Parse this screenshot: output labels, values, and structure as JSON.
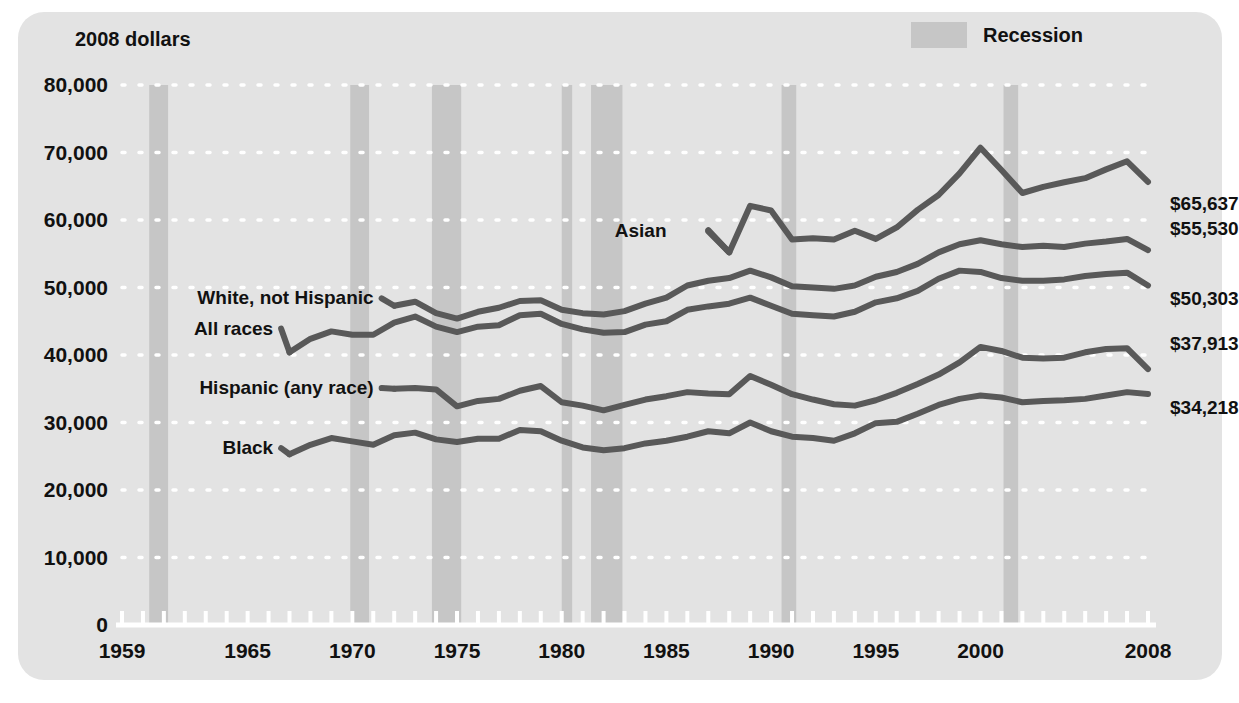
{
  "figure": {
    "unit_label": "2008 dollars",
    "panel_color": "#e3e3e3",
    "line_color": "#595959",
    "recession_color": "#c6c6c6",
    "axis_color": "#ffffff",
    "grid_color": "#ffffff"
  },
  "legend": {
    "position": "top-right",
    "items": [
      {
        "label": "Recession",
        "color": "#c6c6c6",
        "type": "band"
      }
    ]
  },
  "chart_data": {
    "type": "line",
    "title": "",
    "subtitle": "",
    "xlabel": "",
    "ylabel": "2008 dollars",
    "xlim": [
      1959,
      2008
    ],
    "ylim": [
      0,
      80000
    ],
    "grid": "horizontal-dotted",
    "legend_position": "top-right",
    "ytick_labels": [
      "0",
      "10,000",
      "20,000",
      "30,000",
      "40,000",
      "50,000",
      "60,000",
      "70,000",
      "80,000"
    ],
    "ytick_values": [
      0,
      10000,
      20000,
      30000,
      40000,
      50000,
      60000,
      70000,
      80000
    ],
    "xtick_labels": [
      "1959",
      "1965",
      "1970",
      "1975",
      "1980",
      "1985",
      "1990",
      "1995",
      "2000",
      "2008"
    ],
    "xtick_values": [
      1959,
      1965,
      1970,
      1975,
      1980,
      1985,
      1990,
      1995,
      2000,
      2008
    ],
    "x": [
      1959,
      1960,
      1961,
      1962,
      1963,
      1964,
      1965,
      1966,
      1967,
      1968,
      1969,
      1970,
      1971,
      1972,
      1973,
      1974,
      1975,
      1976,
      1977,
      1978,
      1979,
      1980,
      1981,
      1982,
      1983,
      1984,
      1985,
      1986,
      1987,
      1988,
      1989,
      1990,
      1991,
      1992,
      1993,
      1994,
      1995,
      1996,
      1997,
      1998,
      1999,
      2000,
      2001,
      2002,
      2003,
      2004,
      2005,
      2006,
      2007,
      2008
    ],
    "series": [
      {
        "name": "Asian",
        "label": "Asian",
        "end_label": "$65,637",
        "end_value": 65637,
        "label_x": 1987.5,
        "label_y": 58300,
        "start_year": 1987,
        "values": [
          null,
          null,
          null,
          null,
          null,
          null,
          null,
          null,
          null,
          null,
          null,
          null,
          null,
          null,
          null,
          null,
          null,
          null,
          null,
          null,
          null,
          null,
          null,
          null,
          null,
          null,
          null,
          null,
          58500,
          55200,
          62100,
          61400,
          57100,
          57300,
          57100,
          58400,
          57200,
          58900,
          61500,
          63700,
          66900,
          70700,
          67400,
          64000,
          64900,
          65600,
          66200,
          67500,
          68700,
          65637
        ]
      },
      {
        "name": "White, not Hispanic",
        "label": "White, not Hispanic",
        "end_label": "$55,530",
        "end_value": 55530,
        "label_x": 1971.4,
        "label_y": 48400,
        "start_year": 1972,
        "values": [
          null,
          null,
          null,
          null,
          null,
          null,
          null,
          null,
          null,
          null,
          null,
          null,
          null,
          47300,
          47900,
          46200,
          45400,
          46400,
          47000,
          48000,
          48100,
          46700,
          46200,
          46000,
          46500,
          47600,
          48500,
          50300,
          51000,
          51400,
          52500,
          51500,
          50200,
          50000,
          49800,
          50300,
          51600,
          52300,
          53500,
          55200,
          56400,
          57000,
          56400,
          56000,
          56200,
          56000,
          56500,
          56800,
          57200,
          55530
        ]
      },
      {
        "name": "All races",
        "label": "All races",
        "end_label": "$50,303",
        "end_value": 50303,
        "label_x": 1966.6,
        "label_y": 43900,
        "start_year": 1967,
        "values": [
          null,
          null,
          null,
          null,
          null,
          null,
          null,
          null,
          40400,
          42400,
          43500,
          43000,
          43000,
          44800,
          45700,
          44200,
          43400,
          44200,
          44400,
          45900,
          46100,
          44600,
          43800,
          43300,
          43400,
          44500,
          45000,
          46700,
          47200,
          47600,
          48500,
          47300,
          46100,
          45900,
          45700,
          46400,
          47800,
          48400,
          49500,
          51300,
          52500,
          52300,
          51400,
          51000,
          51000,
          51200,
          51700,
          52000,
          52200,
          50303
        ]
      },
      {
        "name": "Hispanic (any race)",
        "label": "Hispanic (any race)",
        "end_label": "$37,913",
        "end_value": 37913,
        "label_x": 1971.4,
        "label_y": 35100,
        "start_year": 1972,
        "values": [
          null,
          null,
          null,
          null,
          null,
          null,
          null,
          null,
          null,
          null,
          null,
          null,
          null,
          35000,
          35100,
          34900,
          32400,
          33200,
          33500,
          34700,
          35400,
          33000,
          32500,
          31800,
          32600,
          33400,
          33900,
          34500,
          34300,
          34200,
          36900,
          35600,
          34200,
          33400,
          32700,
          32500,
          33300,
          34400,
          35700,
          37100,
          38900,
          41200,
          40600,
          39600,
          39500,
          39600,
          40400,
          40900,
          41000,
          37913
        ]
      },
      {
        "name": "Black",
        "label": "Black",
        "end_label": "$34,218",
        "end_value": 34218,
        "label_x": 1966.6,
        "label_y": 26200,
        "start_year": 1967,
        "values": [
          null,
          null,
          null,
          null,
          null,
          null,
          null,
          null,
          25300,
          26700,
          27700,
          27200,
          26700,
          28100,
          28500,
          27500,
          27100,
          27600,
          27600,
          28900,
          28700,
          27300,
          26300,
          25900,
          26200,
          26900,
          27300,
          27900,
          28700,
          28400,
          30000,
          28700,
          27900,
          27700,
          27300,
          28400,
          29900,
          30100,
          31300,
          32600,
          33500,
          34000,
          33700,
          33000,
          33200,
          33300,
          33500,
          34000,
          34500,
          34218
        ]
      }
    ]
  }
}
